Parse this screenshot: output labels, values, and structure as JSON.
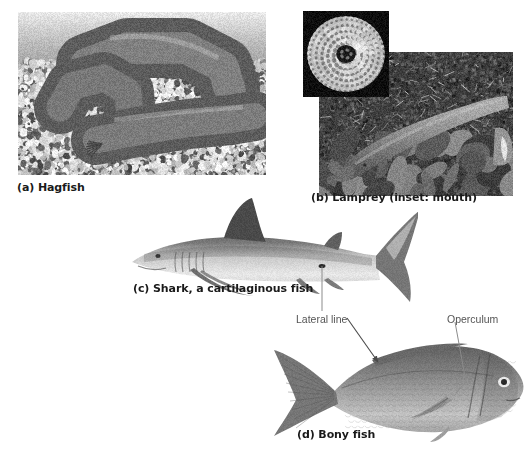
{
  "figure": {
    "panels": [
      {
        "id": "hagfish",
        "caption": "(a) Hagfish",
        "subject": "hagfish",
        "photo": {
          "x": 18,
          "y": 12,
          "w": 248,
          "h": 163
        },
        "caption_pos": {
          "x": 17,
          "y": 181
        }
      },
      {
        "id": "lamprey",
        "caption": "(b) Lamprey (inset: mouth)",
        "subject": "lamprey",
        "photo": {
          "x": 319,
          "y": 52,
          "w": 194,
          "h": 144
        },
        "caption_pos": {
          "x": 311,
          "y": 191
        },
        "inset": {
          "caption": "mouth",
          "subject": "lamprey-mouth",
          "photo": {
            "x": 303,
            "y": 11,
            "w": 86,
            "h": 86
          }
        }
      },
      {
        "id": "shark",
        "caption": "(c) Shark, a cartilaginous fish",
        "subject": "shark",
        "photo": {
          "x": 128,
          "y": 196,
          "w": 290,
          "h": 115
        },
        "caption_pos": {
          "x": 133,
          "y": 282
        }
      },
      {
        "id": "bony-fish",
        "caption": "(d) Bony fish",
        "subject": "bony-fish",
        "photo": {
          "x": 268,
          "y": 332,
          "w": 258,
          "h": 110
        },
        "caption_pos": {
          "x": 297,
          "y": 428
        }
      }
    ],
    "callouts": [
      {
        "id": "lateral-line",
        "label": "Lateral line",
        "label_pos": {
          "x": 296,
          "y": 313
        },
        "leaders": [
          {
            "from": [
              322,
              311
            ],
            "to": [
              322,
              266
            ],
            "arrow": false
          },
          {
            "from": [
              347,
              318
            ],
            "to": [
              378,
              362
            ],
            "arrow": true
          }
        ]
      },
      {
        "id": "operculum",
        "label": "Operculum",
        "label_pos": {
          "x": 447,
          "y": 313
        },
        "leaders": [
          {
            "from": [
              455,
              322
            ],
            "to": [
              466,
              382
            ],
            "arrow": false
          },
          {
            "from": [
              466,
              382
            ],
            "to": [
              456,
              393
            ],
            "arrow": false
          }
        ]
      }
    ],
    "colors": {
      "background": "#ffffff",
      "caption_text": "#1a1a1a",
      "callout_text": "#555555",
      "leader_line": "#8b8b8b"
    }
  }
}
